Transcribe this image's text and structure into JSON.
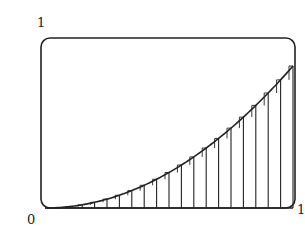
{
  "labels": {
    "y_top": "1",
    "origin": "0",
    "x_right": "1"
  },
  "colors": {
    "stroke": "#222222",
    "background": "#ffffff"
  },
  "chart_data": {
    "type": "area",
    "title": "",
    "function": "y = x^2",
    "xlim": [
      0,
      1
    ],
    "ylim": [
      0,
      1
    ],
    "subintervals": 20,
    "tick_labels": {
      "x": [
        "0",
        "1"
      ],
      "y": [
        "1"
      ]
    },
    "x": [
      0.0,
      0.05,
      0.1,
      0.15,
      0.2,
      0.25,
      0.3,
      0.35,
      0.4,
      0.45,
      0.5,
      0.55,
      0.6,
      0.65,
      0.7,
      0.75,
      0.8,
      0.85,
      0.9,
      0.95,
      1.0
    ],
    "values": [
      0.0,
      0.0025,
      0.01,
      0.0225,
      0.04,
      0.0625,
      0.09,
      0.1225,
      0.16,
      0.2025,
      0.25,
      0.3025,
      0.36,
      0.4225,
      0.49,
      0.5625,
      0.64,
      0.7225,
      0.81,
      0.9025,
      1.0
    ],
    "grid": false,
    "frame": "rounded-rectangle"
  },
  "geometry": {
    "frame": {
      "x": 41,
      "y": 38,
      "w": 254,
      "h": 170,
      "r": 9
    },
    "plot": {
      "x0": 45,
      "x1": 293,
      "y0": 208,
      "y1": 66
    }
  }
}
